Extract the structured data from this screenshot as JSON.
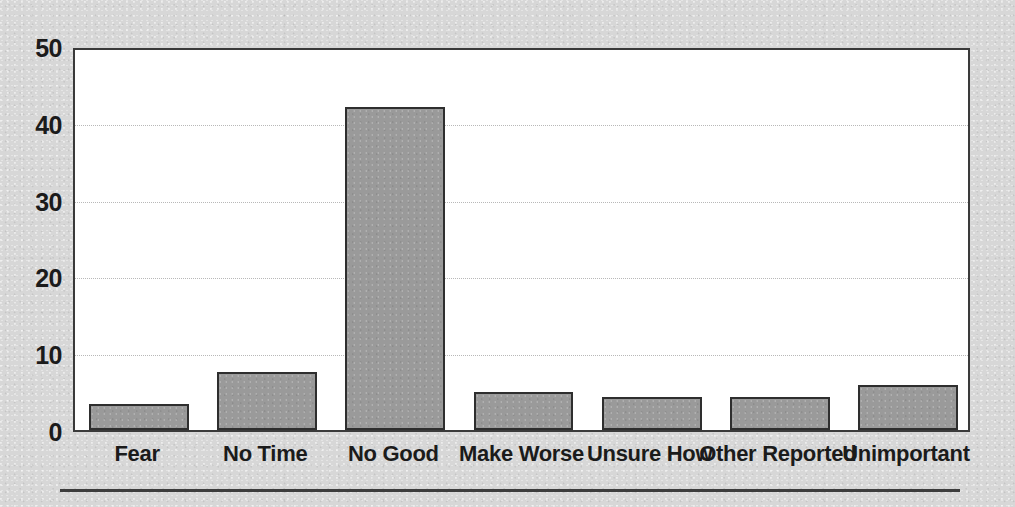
{
  "chart_data": {
    "type": "bar",
    "title": "",
    "subtitle": "",
    "xlabel": "",
    "ylabel": "",
    "categories": [
      "Fear",
      "No Time",
      "No Good",
      "Make Worse",
      "Unsure How",
      "Other Reported",
      "Unimportant"
    ],
    "values": [
      3.4,
      7.5,
      42,
      5.0,
      4.3,
      4.3,
      5.8
    ],
    "ylim": [
      0,
      50
    ],
    "yticks": [
      0,
      10,
      20,
      30,
      40,
      50
    ],
    "ytick_labels": [
      "0",
      "10",
      "20",
      "30",
      "40",
      "50"
    ],
    "grid": true,
    "gridlines_at": [
      10,
      20,
      30,
      40
    ],
    "legend": false,
    "legend_position": "none",
    "annotations": []
  },
  "style": {
    "bar_fill": "#9a9a9a",
    "bar_border": "#2e2e2e",
    "plot_background": "#ffffff",
    "plot_border": "#3a3a3a",
    "canvas_background": "#d7d7d7",
    "gridline_color": "#b8b8b8",
    "text_color": "#1b1b1b",
    "rule_color": "#3d3d3d"
  }
}
